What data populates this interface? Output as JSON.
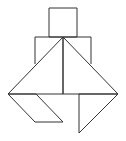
{
  "diagram": {
    "type": "tangram-figure",
    "width": 126,
    "height": 141,
    "stroke_color": "#333333",
    "background": "#ffffff",
    "pieces": [
      {
        "id": "head-square",
        "points": "49,8 77,8 77,37 49,37"
      },
      {
        "id": "shoulders-rect",
        "points": "35,37 91,37 91,64 35,64"
      },
      {
        "id": "left-large-triangle",
        "points": "63,37 8,94 63,94"
      },
      {
        "id": "right-large-triangle",
        "points": "63,37 118,94 63,94"
      },
      {
        "id": "left-parallelogram",
        "points": "8,94 35,122 63,122 36,94"
      },
      {
        "id": "right-small-triangle",
        "points": "79,94 118,94 79,133"
      }
    ]
  }
}
